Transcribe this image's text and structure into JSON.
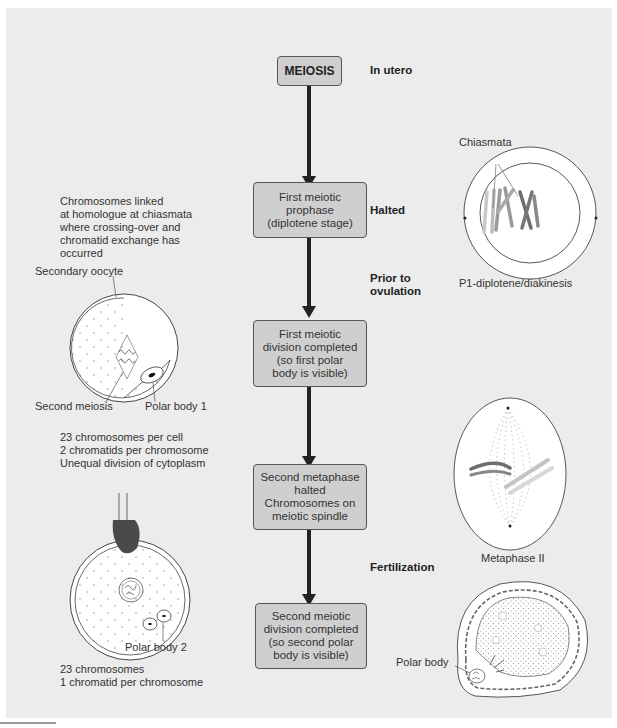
{
  "flow": {
    "boxes": [
      {
        "id": "meiosis",
        "label": "MEIOSIS"
      },
      {
        "id": "prophase",
        "label": "First meiotic\nprophase\n(diplotene stage)"
      },
      {
        "id": "first-division",
        "label": "First meiotic\ndivision completed\n(so first polar\nbody is visible)"
      },
      {
        "id": "second-metaphase",
        "label": "Second metaphase\nhalted\nChromosomes on\nmeiotic spindle"
      },
      {
        "id": "second-division",
        "label": "Second meiotic\ndivision completed\n(so second polar\nbody is visible)"
      }
    ],
    "stages": [
      {
        "label": "In utero"
      },
      {
        "label": "Halted"
      },
      {
        "label": "Prior to\novulation"
      },
      {
        "label": "Fertilization"
      }
    ]
  },
  "left_panel": {
    "chiasmata_note": "Chromosomes linked\nat homologue at chiasmata\nwhere crossing-over and\nchromatid exchange has\noccurred",
    "secondary_oocyte_label": "Secondary oocyte",
    "second_meiosis_label": "Second meiosis",
    "polar_body_1_label": "Polar body 1",
    "first_division_note": "23 chromosomes per cell\n2 chromatids per chromosome\nUnequal division of cytoplasm",
    "polar_body_2_label": "Polar body 2",
    "second_division_note": "23 chromosomes\n1 chromatid per chromosome"
  },
  "right_panel": {
    "chiasmata_label": "Chiasmata",
    "diplotene_caption": "P1-diplotene/diakinesis",
    "metaphase_caption": "Metaphase II",
    "polar_body_label": "Polar body"
  },
  "colors": {
    "panel_bg": "#ececec",
    "box_fill": "#cfcfcf",
    "arrow": "#222222",
    "chromosome_light": "#bdbdbd",
    "chromosome_dark": "#6e6e6e",
    "sperm_head": "#4a4a4a"
  }
}
